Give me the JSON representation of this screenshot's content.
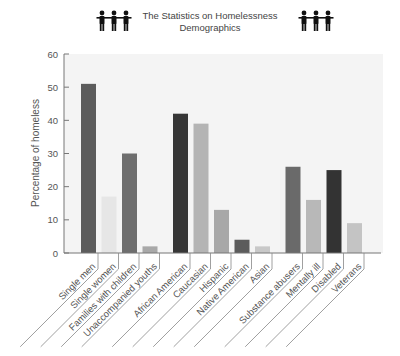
{
  "header": {
    "title_line1": "The Statistics on Homelessness",
    "title_line2": "Demographics",
    "left_icon": "people-group-icon",
    "right_icon": "people-group-icon"
  },
  "colors": {
    "plot_bg": "#f4f4f4",
    "axis": "#777777",
    "text": "#555555"
  },
  "chart_data": {
    "type": "bar",
    "title": "The Statistics on Homelessness Demographics",
    "xlabel": "",
    "ylabel": "Percentage of homeless",
    "ylim": [
      0,
      60
    ],
    "yticks": [
      0,
      10,
      20,
      30,
      40,
      50,
      60
    ],
    "grid": false,
    "legend": null,
    "groups": [
      {
        "name": "Household type",
        "categories": [
          "Single men",
          "Single women",
          "Families with children",
          "Unaccompanied youths"
        ],
        "values": [
          51,
          17,
          30,
          2
        ],
        "colors": [
          "#5c5c5c",
          "#e6e6e6",
          "#6e6e6e",
          "#a8a8a8"
        ]
      },
      {
        "name": "Race / ethnicity",
        "categories": [
          "African American",
          "Caucasian",
          "Hispanic",
          "Native American",
          "Asian"
        ],
        "values": [
          42,
          39,
          13,
          4,
          2
        ],
        "colors": [
          "#363636",
          "#b4b4b4",
          "#a8a8a8",
          "#5c5c5c",
          "#c8c8c8"
        ]
      },
      {
        "name": "Other characteristics",
        "categories": [
          "Substance abusers",
          "Mentally ill",
          "Disabled",
          "Veterans"
        ],
        "values": [
          26,
          16,
          25,
          9
        ],
        "colors": [
          "#6a6a6a",
          "#b8b8b8",
          "#333333",
          "#c4c4c4"
        ]
      }
    ]
  }
}
